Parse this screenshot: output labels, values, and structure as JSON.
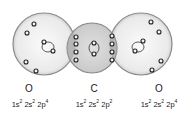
{
  "atoms": [
    {
      "symbol": "O",
      "config": {
        "parts": [
          {
            "base": "1s",
            "exp": "2"
          },
          {
            "base": "2s",
            "exp": "2"
          },
          {
            "base": "2p",
            "exp": "4"
          }
        ]
      }
    },
    {
      "symbol": "C",
      "config": {
        "parts": [
          {
            "base": "1s",
            "exp": "2"
          },
          {
            "base": "2s",
            "exp": "2"
          },
          {
            "base": "2p",
            "exp": "2"
          }
        ]
      }
    },
    {
      "symbol": "O",
      "config": {
        "parts": [
          {
            "base": "1s",
            "exp": "2"
          },
          {
            "base": "2s",
            "exp": "2"
          },
          {
            "base": "2p",
            "exp": "4"
          }
        ]
      }
    }
  ],
  "colors": {
    "outer_shell_fill": "#ececec",
    "carbon_fill": "#c8c8c8",
    "overlap_fill": "#a8a8a8",
    "shell_stroke": "#8a8a8a",
    "electron_stroke": "#222222",
    "electron_fill": "#f4f4f4"
  }
}
